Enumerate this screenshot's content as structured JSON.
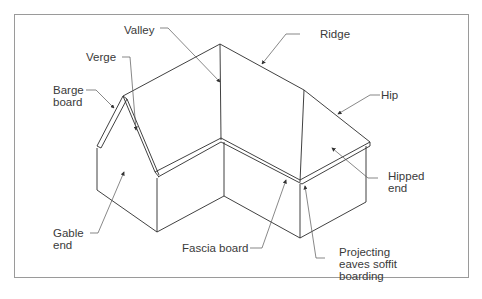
{
  "diagram": {
    "labels": {
      "valley": "Valley",
      "ridge": "Ridge",
      "verge": "Verge",
      "barge_board": "Barge\nboard",
      "hip": "Hip",
      "hipped_end": "Hipped\nend",
      "gable_end": "Gable\nend",
      "fascia_board": "Fascia board",
      "projecting_eaves": "Projecting\neaves soffit\nboarding"
    },
    "colors": {
      "line": "#2b2b2b",
      "leader": "#555555",
      "frame": "#9a9a9a",
      "text": "#3a3a3a"
    }
  }
}
